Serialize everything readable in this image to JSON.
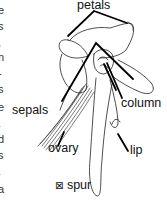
{
  "figure": {
    "labels": {
      "petals": "petals",
      "sepals": "sepals",
      "column": "column",
      "ovary": "ovary",
      "lip": "lip",
      "spur": "spur",
      "spur_marker": "⊠"
    }
  },
  "cropped_body_text": {
    "edge_chars": [
      "e",
      "s",
      ",",
      "n",
      "-",
      "s",
      "e",
      ".",
      "d",
      "s",
      ".",
      "a"
    ]
  },
  "colors": {
    "ink": "#111111",
    "background": "#ffffff"
  }
}
